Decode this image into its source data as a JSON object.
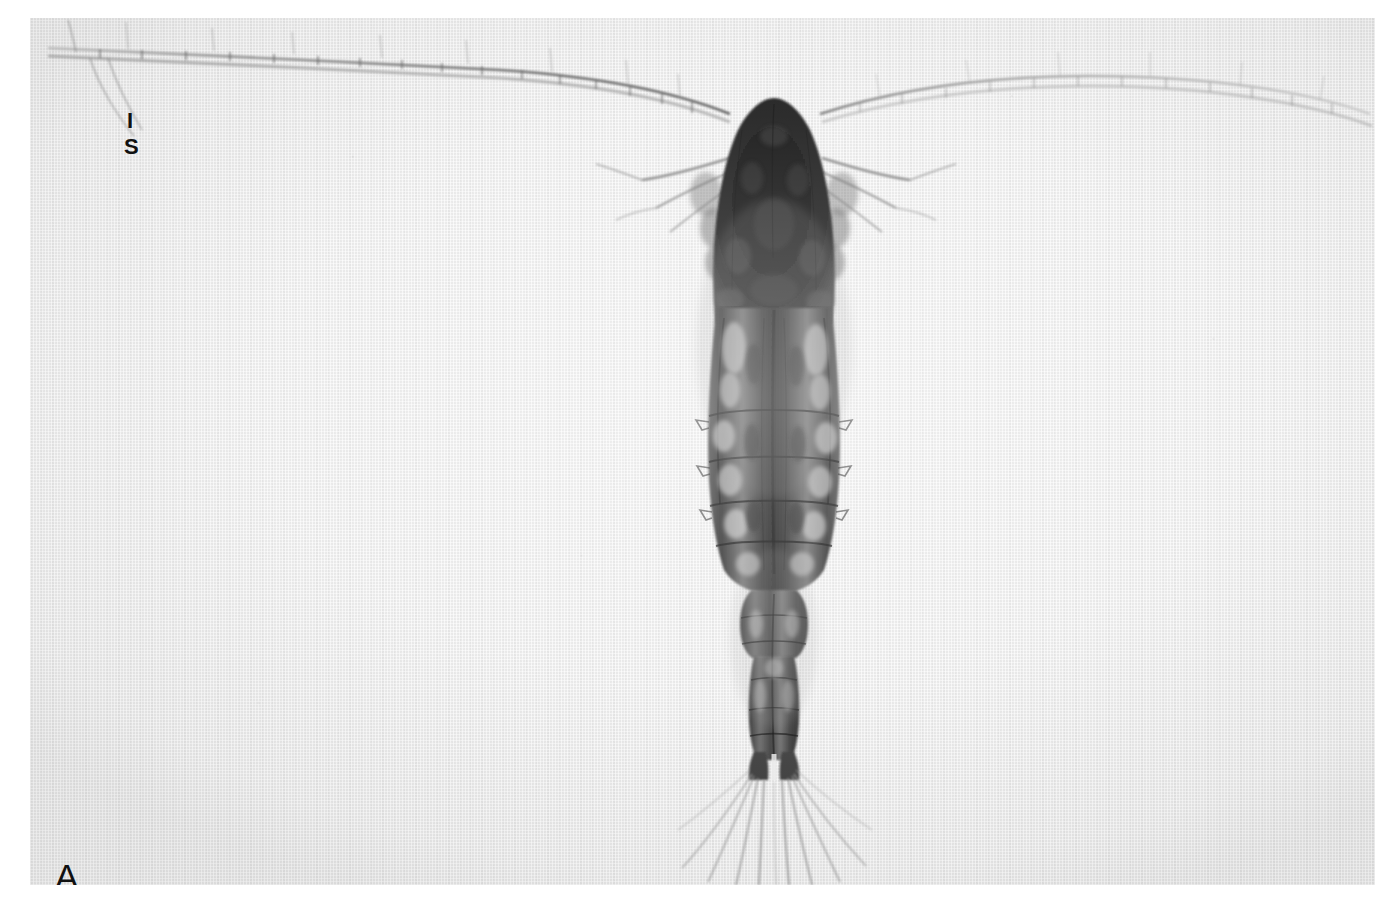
{
  "figure": {
    "domain": "photomicrograph",
    "width": 1382,
    "height": 908,
    "page_background": "#ffffff",
    "plate_background": "#ededed",
    "view": "dorsal",
    "technique": "transmitted-light-microscopy",
    "rendering": "grayscale"
  },
  "plate": {
    "left": 30,
    "top": 18,
    "width": 1345,
    "height": 867,
    "paper_tone": "#ededed"
  },
  "labels": {
    "panel": "A",
    "landmark_upper": "I",
    "landmark_lower": "S"
  },
  "anatomy": {
    "head": {
      "name": "cephalosome",
      "tone": "#141414",
      "apex_x": 744,
      "apex_y": 90,
      "width": 152,
      "bottom_y": 300
    },
    "prosome": {
      "name": "prosome-thorax",
      "tone": "#3a3a3a",
      "top_y": 255,
      "bottom_y": 570,
      "max_width": 160,
      "segments": 5
    },
    "urosome": {
      "name": "urosome",
      "tone": "#555555",
      "top_y": 568,
      "bottom_y": 740,
      "width": 52,
      "segments": 4
    },
    "caudal_rami": {
      "name": "caudal-rami",
      "top_y": 715,
      "bottom_y": 748,
      "count": 2
    },
    "caudal_setae": {
      "name": "caudal-setae",
      "count": 9,
      "origin_y": 745,
      "max_length": 140,
      "tone": "#8a8a8a"
    },
    "antennule_left": {
      "name": "left-antennule",
      "tip_x": 48,
      "tip_y": 47,
      "base_x": 700,
      "base_y": 108,
      "segments": 19,
      "tone": "#7b7b7b"
    },
    "antennule_right": {
      "name": "right-antennule",
      "tip_x": 1368,
      "tip_y": 100,
      "base_x": 790,
      "base_y": 108,
      "segments": 19,
      "tone": "#9a9a9a"
    },
    "antenna_left": {
      "name": "left-second-antenna",
      "tone": "#6f6f6f"
    },
    "antenna_right": {
      "name": "right-second-antenna",
      "tone": "#6f6f6f"
    },
    "swimming_legs": {
      "name": "swimming-legs",
      "pairs": 5
    }
  },
  "palette": {
    "darkest": "#0d0d0d",
    "dark": "#2a2a2a",
    "mid": "#5e5e5e",
    "light": "#9d9d9d",
    "faint": "#c4c4c4",
    "background": "#ededed",
    "page": "#ffffff",
    "label_ink": "#111111"
  }
}
